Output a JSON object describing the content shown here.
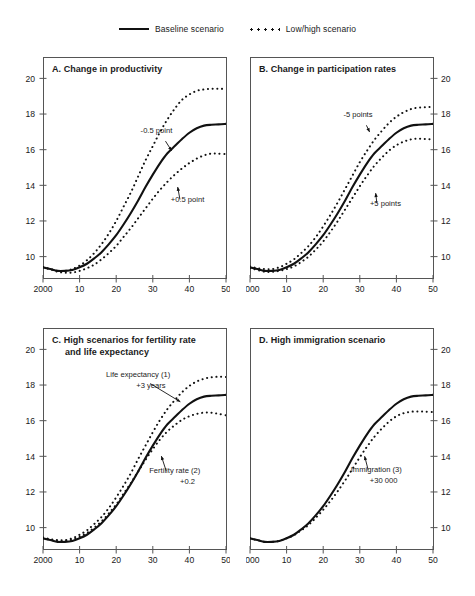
{
  "legend": {
    "items": [
      {
        "label": "Baseline scenario",
        "style": "solid",
        "icon": "solid-line-icon"
      },
      {
        "label": "Low/high scenario",
        "style": "dotted",
        "icon": "dotted-line-icon"
      }
    ]
  },
  "axis": {
    "x_ticks": [
      "2000",
      "10",
      "20",
      "30",
      "40",
      "50"
    ],
    "x_values": [
      2000,
      2010,
      2020,
      2030,
      2040,
      2050
    ],
    "y_ticks": [
      "10",
      "12",
      "14",
      "16",
      "18",
      "20"
    ],
    "y_values": [
      10,
      12,
      14,
      16,
      18,
      20
    ],
    "xlim": [
      2000,
      2050
    ],
    "ylim": [
      8.8,
      21.2
    ]
  },
  "chart_data": [
    {
      "type": "line",
      "panel": "A",
      "title": "A.  Change in productivity",
      "title_lines": [
        "A.  Change in productivity"
      ],
      "xlabel": "",
      "ylabel": "",
      "y_axis_side": "left",
      "xlim": [
        2000,
        2050
      ],
      "ylim": [
        8.8,
        21.2
      ],
      "xticks": [
        2000,
        2010,
        2020,
        2030,
        2040,
        2050
      ],
      "xticklabels": [
        "2000",
        "10",
        "20",
        "30",
        "40",
        "50"
      ],
      "yticks": [
        10,
        12,
        14,
        16,
        18,
        20
      ],
      "yticklabels": [
        "10",
        "12",
        "14",
        "16",
        "18",
        "20"
      ],
      "grid": false,
      "legend_position": "figure-top-center",
      "annotations": [
        {
          "text": "-0.5 point",
          "x": 2031,
          "y": 16.95,
          "target_x": 2035.5,
          "target_y": 15.85
        },
        {
          "text": "+0.5 point",
          "x": 2039.5,
          "y": 13.05,
          "target_x": 2036.5,
          "target_y": 14.0
        }
      ],
      "x": [
        2000,
        2002,
        2004,
        2006,
        2008,
        2010,
        2012,
        2014,
        2016,
        2018,
        2020,
        2022,
        2024,
        2026,
        2028,
        2030,
        2032,
        2034,
        2036,
        2038,
        2040,
        2042,
        2044,
        2046,
        2048,
        2050
      ],
      "series": [
        {
          "name": "Baseline scenario",
          "style": "solid",
          "values": [
            9.4,
            9.3,
            9.2,
            9.2,
            9.25,
            9.4,
            9.6,
            9.9,
            10.25,
            10.7,
            11.2,
            11.8,
            12.45,
            13.15,
            13.9,
            14.6,
            15.25,
            15.8,
            16.2,
            16.6,
            16.95,
            17.2,
            17.35,
            17.4,
            17.42,
            17.45
          ]
        },
        {
          "name": "Low/high scenario (-0.5 point)",
          "style": "dotted",
          "values": [
            9.4,
            9.3,
            9.2,
            9.2,
            9.3,
            9.5,
            9.8,
            10.2,
            10.7,
            11.3,
            12.0,
            12.8,
            13.6,
            14.5,
            15.4,
            16.2,
            17.0,
            17.7,
            18.3,
            18.8,
            19.1,
            19.3,
            19.38,
            19.42,
            19.42,
            19.4
          ]
        },
        {
          "name": "Low/high scenario (+0.5 point)",
          "style": "dotted",
          "values": [
            9.4,
            9.3,
            9.15,
            9.1,
            9.1,
            9.2,
            9.35,
            9.55,
            9.85,
            10.2,
            10.6,
            11.1,
            11.6,
            12.15,
            12.7,
            13.25,
            13.75,
            14.2,
            14.6,
            14.95,
            15.25,
            15.5,
            15.68,
            15.78,
            15.78,
            15.75
          ]
        }
      ]
    },
    {
      "type": "line",
      "panel": "B",
      "title": "B.  Change in participation rates",
      "title_lines": [
        "B.  Change in participation rates"
      ],
      "xlabel": "",
      "ylabel": "",
      "y_axis_side": "right",
      "xlim": [
        2000,
        2050
      ],
      "ylim": [
        8.8,
        21.2
      ],
      "xticks": [
        2000,
        2010,
        2020,
        2030,
        2040,
        2050
      ],
      "xticklabels": [
        "2000",
        "10",
        "20",
        "30",
        "40",
        "50"
      ],
      "yticks": [
        10,
        12,
        14,
        16,
        18,
        20
      ],
      "yticklabels": [
        "10",
        "12",
        "14",
        "16",
        "18",
        "20"
      ],
      "grid": false,
      "annotations": [
        {
          "text": "-5 points",
          "x": 2029.5,
          "y": 17.85,
          "target_x": 2033.0,
          "target_y": 16.9
        },
        {
          "text": "+5 points",
          "x": 2037.0,
          "y": 12.85,
          "target_x": 2034.0,
          "target_y": 13.65
        }
      ],
      "x": [
        2000,
        2002,
        2004,
        2006,
        2008,
        2010,
        2012,
        2014,
        2016,
        2018,
        2020,
        2022,
        2024,
        2026,
        2028,
        2030,
        2032,
        2034,
        2036,
        2038,
        2040,
        2042,
        2044,
        2046,
        2048,
        2050
      ],
      "series": [
        {
          "name": "Baseline scenario",
          "style": "solid",
          "values": [
            9.4,
            9.3,
            9.2,
            9.2,
            9.25,
            9.4,
            9.6,
            9.9,
            10.25,
            10.7,
            11.2,
            11.8,
            12.45,
            13.15,
            13.9,
            14.6,
            15.25,
            15.8,
            16.2,
            16.6,
            16.95,
            17.2,
            17.35,
            17.4,
            17.42,
            17.45
          ]
        },
        {
          "name": "Low/high scenario (-5 points)",
          "style": "dotted",
          "values": [
            9.45,
            9.35,
            9.3,
            9.3,
            9.4,
            9.6,
            9.85,
            10.2,
            10.6,
            11.1,
            11.7,
            12.35,
            13.05,
            13.8,
            14.55,
            15.3,
            15.95,
            16.55,
            17.05,
            17.5,
            17.85,
            18.1,
            18.28,
            18.36,
            18.38,
            18.4
          ]
        },
        {
          "name": "Low/high scenario (+5 points)",
          "style": "dotted",
          "values": [
            9.35,
            9.25,
            9.15,
            9.15,
            9.2,
            9.3,
            9.45,
            9.7,
            10.0,
            10.4,
            10.85,
            11.4,
            12.0,
            12.65,
            13.3,
            13.95,
            14.55,
            15.1,
            15.55,
            15.95,
            16.25,
            16.45,
            16.58,
            16.62,
            16.6,
            16.58
          ]
        }
      ]
    },
    {
      "type": "line",
      "panel": "C",
      "title": "C.  High scenarios for fertility rate and life expectancy",
      "title_lines": [
        "C.  High scenarios for fertility rate",
        "and life expectancy"
      ],
      "xlabel": "",
      "ylabel": "",
      "y_axis_side": "left",
      "xlim": [
        2000,
        2050
      ],
      "ylim": [
        8.8,
        21.2
      ],
      "xticks": [
        2000,
        2010,
        2020,
        2030,
        2040,
        2050
      ],
      "xticklabels": [
        "2000",
        "10",
        "20",
        "30",
        "40",
        "50"
      ],
      "yticks": [
        10,
        12,
        14,
        16,
        18,
        20
      ],
      "yticklabels": [
        "10",
        "12",
        "14",
        "16",
        "18",
        "20"
      ],
      "grid": false,
      "annotations": [
        {
          "text": "Life expectancy (1)",
          "x": 2026.0,
          "y": 18.45,
          "target_x": 2038.0,
          "target_y": 17.0
        },
        {
          "text": "+3 years",
          "x": 2029.5,
          "y": 17.85,
          "target_x": null,
          "target_y": null
        },
        {
          "text": "Fertility rate (2)",
          "x": 2036.0,
          "y": 13.05,
          "target_x": 2032.0,
          "target_y": 14.1
        },
        {
          "text": "+0.2",
          "x": 2039.5,
          "y": 12.45,
          "target_x": null,
          "target_y": null
        }
      ],
      "x": [
        2000,
        2002,
        2004,
        2006,
        2008,
        2010,
        2012,
        2014,
        2016,
        2018,
        2020,
        2022,
        2024,
        2026,
        2028,
        2030,
        2032,
        2034,
        2036,
        2038,
        2040,
        2042,
        2044,
        2046,
        2048,
        2050
      ],
      "series": [
        {
          "name": "Baseline scenario",
          "style": "solid",
          "values": [
            9.4,
            9.3,
            9.2,
            9.2,
            9.25,
            9.4,
            9.6,
            9.9,
            10.25,
            10.7,
            11.2,
            11.8,
            12.45,
            13.15,
            13.9,
            14.6,
            15.25,
            15.8,
            16.2,
            16.6,
            16.95,
            17.2,
            17.35,
            17.4,
            17.42,
            17.45
          ]
        },
        {
          "name": "Life expectancy (1) +3 years",
          "style": "dotted",
          "values": [
            9.45,
            9.35,
            9.3,
            9.3,
            9.4,
            9.6,
            9.85,
            10.2,
            10.6,
            11.1,
            11.7,
            12.35,
            13.05,
            13.85,
            14.6,
            15.35,
            16.05,
            16.65,
            17.15,
            17.6,
            17.95,
            18.2,
            18.35,
            18.44,
            18.46,
            18.45
          ]
        },
        {
          "name": "Fertility rate (2) +0.2",
          "style": "dotted",
          "values": [
            9.4,
            9.32,
            9.25,
            9.25,
            9.32,
            9.48,
            9.7,
            10.0,
            10.35,
            10.8,
            11.3,
            11.9,
            12.5,
            13.15,
            13.8,
            14.4,
            14.95,
            15.4,
            15.75,
            16.05,
            16.25,
            16.38,
            16.45,
            16.45,
            16.38,
            16.3
          ]
        }
      ]
    },
    {
      "type": "line",
      "panel": "D",
      "title": "D.  High immigration scenario",
      "title_lines": [
        "D.  High immigration scenario"
      ],
      "xlabel": "",
      "ylabel": "",
      "y_axis_side": "right",
      "xlim": [
        2000,
        2050
      ],
      "ylim": [
        8.8,
        21.2
      ],
      "xticks": [
        2000,
        2010,
        2020,
        2030,
        2040,
        2050
      ],
      "xticklabels": [
        "2000",
        "10",
        "20",
        "30",
        "40",
        "50"
      ],
      "yticks": [
        10,
        12,
        14,
        16,
        18,
        20
      ],
      "yticklabels": [
        "10",
        "12",
        "14",
        "16",
        "18",
        "20"
      ],
      "grid": false,
      "annotations": [
        {
          "text": "Immigration (3)",
          "x": 2034.5,
          "y": 13.1,
          "target_x": 2031.0,
          "target_y": 14.1
        },
        {
          "text": "+30 000",
          "x": 2036.5,
          "y": 12.5,
          "target_x": null,
          "target_y": null
        }
      ],
      "x": [
        2000,
        2002,
        2004,
        2006,
        2008,
        2010,
        2012,
        2014,
        2016,
        2018,
        2020,
        2022,
        2024,
        2026,
        2028,
        2030,
        2032,
        2034,
        2036,
        2038,
        2040,
        2042,
        2044,
        2046,
        2048,
        2050
      ],
      "series": [
        {
          "name": "Baseline scenario",
          "style": "solid",
          "values": [
            9.4,
            9.3,
            9.2,
            9.2,
            9.25,
            9.4,
            9.6,
            9.9,
            10.25,
            10.7,
            11.2,
            11.8,
            12.45,
            13.15,
            13.9,
            14.6,
            15.25,
            15.8,
            16.2,
            16.6,
            16.95,
            17.2,
            17.35,
            17.4,
            17.42,
            17.45
          ]
        },
        {
          "name": "Immigration (3) +30 000",
          "style": "dotted",
          "values": [
            9.4,
            9.3,
            9.2,
            9.2,
            9.25,
            9.4,
            9.58,
            9.85,
            10.15,
            10.55,
            11.0,
            11.5,
            12.05,
            12.65,
            13.3,
            13.95,
            14.55,
            15.1,
            15.55,
            15.95,
            16.25,
            16.42,
            16.5,
            16.52,
            16.5,
            16.48
          ]
        }
      ]
    }
  ],
  "colors": {
    "ink": "#1a1a1a",
    "line": "#111111",
    "axis": "#555555",
    "background": "#ffffff"
  }
}
